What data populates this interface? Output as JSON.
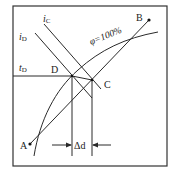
{
  "diagram": {
    "type": "psychrometric-id-diagram",
    "colors": {
      "line": "#2a2a2a",
      "background": "#ffffff"
    },
    "labels": {
      "iC": {
        "main": "i",
        "sub": "C"
      },
      "iD": {
        "main": "i",
        "sub": "D"
      },
      "tD": {
        "main": "t",
        "sub": "D"
      },
      "phi": "φ=100%",
      "A": "A",
      "B": "B",
      "C": "C",
      "D": "D",
      "delta_d": "Δd"
    },
    "points": [
      {
        "name": "A",
        "x": 30,
        "y": 144
      },
      {
        "name": "B",
        "x": 149,
        "y": 20
      },
      {
        "name": "C",
        "x": 92,
        "y": 80
      },
      {
        "name": "D",
        "x": 72,
        "y": 76
      }
    ]
  }
}
